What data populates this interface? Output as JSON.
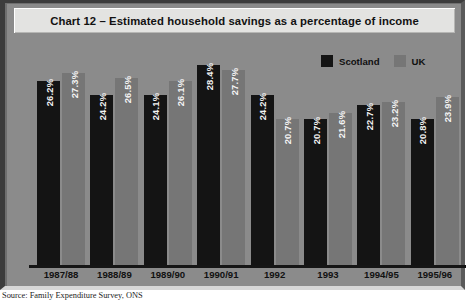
{
  "title": {
    "text": "Chart 12 – Estimated household savings as a percentage of income"
  },
  "legend": {
    "position": "top-right",
    "entries": [
      {
        "label": "Scotland",
        "color": "#141414"
      },
      {
        "label": "UK",
        "color": "#767676"
      }
    ]
  },
  "source": {
    "text": "Source: Family Expenditure Survey, ONS"
  },
  "colors": {
    "background": "#8b8b8b",
    "title_box": "#e3e3e1",
    "scotland": "#141414",
    "uk": "#767676",
    "axis": "#151515"
  },
  "chart_data": {
    "type": "bar",
    "title": "Chart 12 – Estimated household savings as a percentage of income",
    "xlabel": "",
    "ylabel": "",
    "ylim": [
      0,
      30
    ],
    "grid": false,
    "legend_position": "top-right",
    "categories": [
      "1987/88",
      "1988/89",
      "1989/90",
      "1990/91",
      "1992",
      "1993",
      "1994/95",
      "1995/96"
    ],
    "series": [
      {
        "name": "Scotland",
        "color": "#141414",
        "values": [
          26.2,
          24.2,
          24.1,
          28.4,
          24.2,
          20.7,
          22.7,
          20.8
        ],
        "labels": [
          "26.2%",
          "24.2%",
          "24.1%",
          "28.4%",
          "24.2%",
          "20.7%",
          "22.7%",
          "20.8%"
        ]
      },
      {
        "name": "UK",
        "color": "#767676",
        "values": [
          27.3,
          26.5,
          26.1,
          27.7,
          20.7,
          21.6,
          23.2,
          23.9
        ],
        "labels": [
          "27.3%",
          "26.5%",
          "26.1%",
          "27.7%",
          "20.7%",
          "21.6%",
          "23.2%",
          "23.9%"
        ]
      }
    ]
  }
}
